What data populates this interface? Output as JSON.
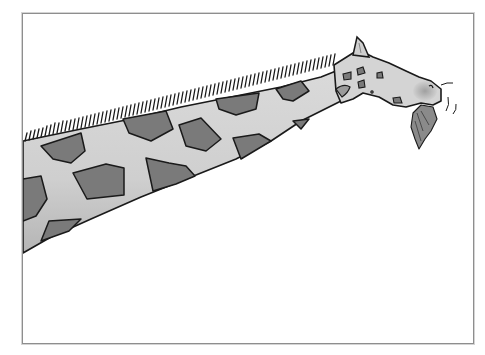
{
  "illustration": {
    "subject": "Cartoon giraffe with long spotted neck eating leaves",
    "caption": "Giraffe illustration",
    "colors": {
      "background": "#ffffff",
      "frame_border": "#8e8e8e",
      "neck_fill": "#d2d2d2",
      "neck_shadow": "#b8b8b8",
      "spot_fill": "#7a7a7a",
      "outline": "#1a1a1a",
      "leaves": "#8a8a8a"
    }
  }
}
